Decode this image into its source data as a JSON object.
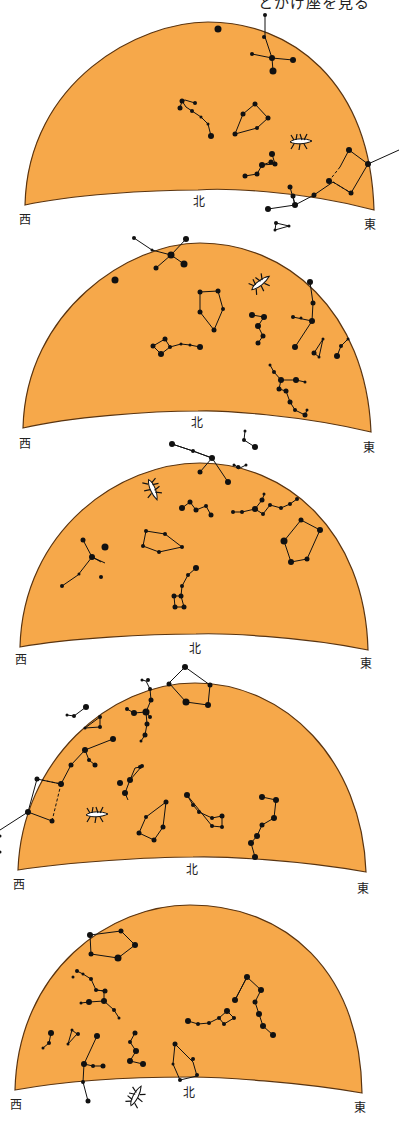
{
  "header": {
    "title_partial": "とかげ座を見る"
  },
  "colors": {
    "sky": "#F6A84A",
    "outline": "#5a3410",
    "star": "#111111",
    "lizard_fill": "#ffffff"
  },
  "panels": [
    {
      "west": "西",
      "north": "北",
      "east": "東",
      "lizard": "lacerta-icon"
    },
    {
      "west": "西",
      "north": "北",
      "east": "東",
      "lizard": "lacerta-icon"
    },
    {
      "west": "西",
      "north": "北",
      "east": "東",
      "lizard": "lacerta-icon"
    },
    {
      "west": "西",
      "north": "北",
      "east": "東",
      "lizard": "lacerta-icon"
    },
    {
      "west": "西",
      "north": "北",
      "east": "東",
      "lizard": "lacerta-icon"
    }
  ]
}
